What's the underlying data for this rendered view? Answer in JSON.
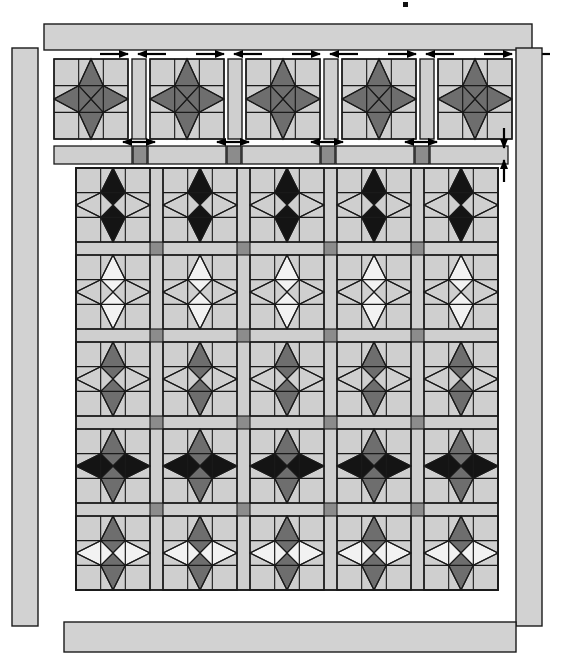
{
  "figure": {
    "title": "",
    "type": "quilt-construction-diagram",
    "canvas": {
      "width": 577,
      "height": 659
    },
    "background": "#ffffff"
  },
  "palette": {
    "fabric_light_gray": "#cfcfcf",
    "fabric_border_gray": "#d2d2d2",
    "fabric_mid_gray": "#9a9a9a",
    "fabric_dark_gray": "#6e6e6e",
    "fabric_black": "#141414",
    "fabric_white": "#f2f2f2",
    "fabric_cornerstone": "#8c8c8c",
    "outline": "#1a1a1a",
    "arrow": "#000000"
  },
  "legend_rows": [
    {
      "row": 1,
      "vertical_diamond": "black",
      "horizontal_diamond": "light_gray"
    },
    {
      "row": 2,
      "vertical_diamond": "white",
      "horizontal_diamond": "light_gray"
    },
    {
      "row": 3,
      "vertical_diamond": "dark_gray",
      "horizontal_diamond": "light_gray"
    },
    {
      "row": 4,
      "vertical_diamond": "dark_gray",
      "horizontal_diamond": "black"
    },
    {
      "row": 5,
      "vertical_diamond": "dark_gray",
      "horizontal_diamond": "white"
    }
  ],
  "top_assembly_row": {
    "label": "top sashing row",
    "blocks": 5,
    "vertical_diamond": "dark_gray",
    "horizontal_diamond": "dark_gray"
  },
  "main_body": {
    "rows": 5,
    "columns": 5,
    "sashing_color": "light_gray",
    "cornerstone_color": "cornerstone"
  },
  "borders": {
    "top_label": "top border strip",
    "bottom_label": "bottom border strip",
    "left_label": "left border strip",
    "right_label": "right border strip"
  },
  "arrows": {
    "top_pairs": 5,
    "mid_pairs": 4,
    "right_vertical": 2,
    "description": "assembly direction markers"
  },
  "marks": {
    "corner_dot": "•"
  }
}
